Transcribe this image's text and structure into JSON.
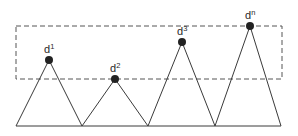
{
  "diagram": {
    "type": "peaks-threshold",
    "colors": {
      "stroke": "#3a3a3a",
      "dot": "#222222",
      "dashed": "#555555",
      "background": "#ffffff"
    },
    "threshold_box": {
      "x1": 16,
      "y1": 26,
      "x2": 282,
      "y2": 79,
      "style": "dashed"
    },
    "baseline": {
      "x1": 16,
      "x2": 281,
      "y": 126
    },
    "valleys_x": [
      16,
      82,
      148,
      215,
      281
    ],
    "peaks": [
      {
        "id": "d1",
        "base": "d",
        "sup": "1",
        "x": 49,
        "y": 60
      },
      {
        "id": "d2",
        "base": "d",
        "sup": "2",
        "x": 115,
        "y": 79
      },
      {
        "id": "d3",
        "base": "d",
        "sup": "3",
        "x": 182,
        "y": 42
      },
      {
        "id": "dn",
        "base": "d",
        "sup": "n",
        "x": 250,
        "y": 26
      }
    ]
  }
}
